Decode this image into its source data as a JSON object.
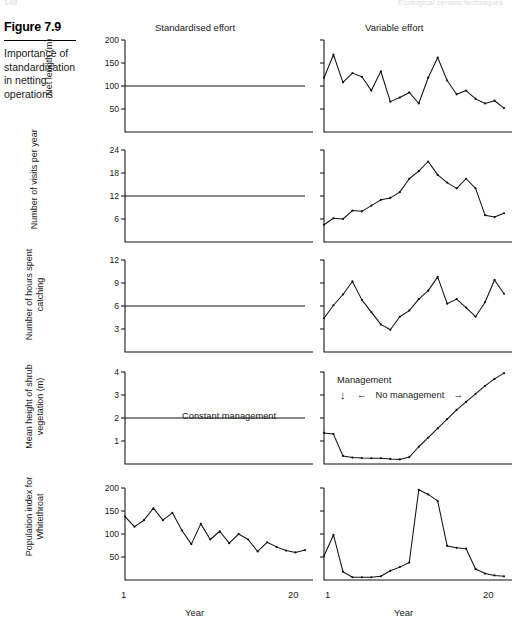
{
  "page": {
    "running_head_left": "148",
    "running_head_right": "Ecological census techniques"
  },
  "figure": {
    "number": "Figure 7.9",
    "caption": "Importance of standardisation in netting operations"
  },
  "columns": {
    "left_header": "Standardised effort",
    "right_header": "Variable effort"
  },
  "axis": {
    "x_label": "Year",
    "x_start": "1",
    "x_end": "20"
  },
  "annotations": {
    "constant_management": "Constant management",
    "management": "Management",
    "no_management": "No management",
    "arrow_down": "↓",
    "arrow_left": "←",
    "arrow_right": "→"
  },
  "chart_data": [
    {
      "id": "net-length-standardised",
      "type": "line",
      "row": 1,
      "column": "left",
      "title": "",
      "ylabel": "Net length (m)",
      "xlabel": "Year",
      "ylim": [
        0,
        200
      ],
      "yticks": [
        50,
        100,
        150,
        200
      ],
      "ytick_labels": [
        "50",
        "100",
        "150",
        "200"
      ],
      "xlim": [
        1,
        20
      ],
      "grid": false,
      "constant_value": 100,
      "x": [
        1,
        2,
        3,
        4,
        5,
        6,
        7,
        8,
        9,
        10,
        11,
        12,
        13,
        14,
        15,
        16,
        17,
        18,
        19,
        20
      ],
      "values": [
        100,
        100,
        100,
        100,
        100,
        100,
        100,
        100,
        100,
        100,
        100,
        100,
        100,
        100,
        100,
        100,
        100,
        100,
        100,
        100
      ]
    },
    {
      "id": "net-length-variable",
      "type": "line",
      "row": 1,
      "column": "right",
      "title": "",
      "ylabel": "Net length (m)",
      "xlabel": "Year",
      "ylim": [
        0,
        200
      ],
      "yticks": [
        50,
        100,
        150,
        200
      ],
      "ytick_labels": [
        "",
        "",
        "",
        ""
      ],
      "xlim": [
        1,
        20
      ],
      "grid": false,
      "x": [
        1,
        2,
        3,
        4,
        5,
        6,
        7,
        8,
        9,
        10,
        11,
        12,
        13,
        14,
        15,
        16,
        17,
        18,
        19,
        20
      ],
      "values": [
        118,
        168,
        108,
        128,
        120,
        90,
        132,
        66,
        75,
        86,
        62,
        118,
        162,
        112,
        82,
        90,
        72,
        62,
        68,
        52
      ]
    },
    {
      "id": "visits-standardised",
      "type": "line",
      "row": 2,
      "column": "left",
      "title": "",
      "ylabel": "Number of visits per year",
      "xlabel": "Year",
      "ylim": [
        0,
        24
      ],
      "yticks": [
        6,
        12,
        18,
        24
      ],
      "ytick_labels": [
        "6",
        "12",
        "18",
        "24"
      ],
      "xlim": [
        1,
        20
      ],
      "grid": false,
      "constant_value": 12,
      "x": [
        1,
        2,
        3,
        4,
        5,
        6,
        7,
        8,
        9,
        10,
        11,
        12,
        13,
        14,
        15,
        16,
        17,
        18,
        19,
        20
      ],
      "values": [
        12,
        12,
        12,
        12,
        12,
        12,
        12,
        12,
        12,
        12,
        12,
        12,
        12,
        12,
        12,
        12,
        12,
        12,
        12,
        12
      ]
    },
    {
      "id": "visits-variable",
      "type": "line",
      "row": 2,
      "column": "right",
      "title": "",
      "ylabel": "Number of visits per year",
      "xlabel": "Year",
      "ylim": [
        0,
        24
      ],
      "yticks": [
        6,
        12,
        18,
        24
      ],
      "ytick_labels": [
        "",
        "",
        "",
        ""
      ],
      "xlim": [
        1,
        20
      ],
      "grid": false,
      "x": [
        1,
        2,
        3,
        4,
        5,
        6,
        7,
        8,
        9,
        10,
        11,
        12,
        13,
        14,
        15,
        16,
        17,
        18,
        19,
        20
      ],
      "values": [
        4.5,
        6.2,
        6.0,
        8.2,
        8.0,
        9.5,
        11.0,
        11.5,
        13.0,
        16.5,
        18.5,
        21.0,
        17.5,
        15.5,
        14.0,
        16.5,
        14.0,
        7.0,
        6.5,
        7.5
      ]
    },
    {
      "id": "hours-standardised",
      "type": "line",
      "row": 3,
      "column": "left",
      "title": "",
      "ylabel": "Number of hours spent catching",
      "xlabel": "Year",
      "ylim": [
        0,
        12
      ],
      "yticks": [
        3,
        6,
        9,
        12
      ],
      "ytick_labels": [
        "3",
        "6",
        "9",
        "12"
      ],
      "xlim": [
        1,
        20
      ],
      "grid": false,
      "constant_value": 6,
      "x": [
        1,
        2,
        3,
        4,
        5,
        6,
        7,
        8,
        9,
        10,
        11,
        12,
        13,
        14,
        15,
        16,
        17,
        18,
        19,
        20
      ],
      "values": [
        6,
        6,
        6,
        6,
        6,
        6,
        6,
        6,
        6,
        6,
        6,
        6,
        6,
        6,
        6,
        6,
        6,
        6,
        6,
        6
      ]
    },
    {
      "id": "hours-variable",
      "type": "line",
      "row": 3,
      "column": "right",
      "title": "",
      "ylabel": "Number of hours spent catching",
      "xlabel": "Year",
      "ylim": [
        0,
        12
      ],
      "yticks": [
        3,
        6,
        9,
        12
      ],
      "ytick_labels": [
        "",
        "",
        "",
        ""
      ],
      "xlim": [
        1,
        20
      ],
      "grid": false,
      "x": [
        1,
        2,
        3,
        4,
        5,
        6,
        7,
        8,
        9,
        10,
        11,
        12,
        13,
        14,
        15,
        16,
        17,
        18,
        19,
        20
      ],
      "values": [
        4.4,
        6.1,
        7.5,
        9.2,
        6.8,
        5.2,
        3.6,
        2.9,
        4.6,
        5.4,
        6.9,
        8.0,
        9.8,
        6.3,
        6.9,
        5.8,
        4.6,
        6.5,
        9.4,
        7.6
      ]
    },
    {
      "id": "shrub-standardised",
      "type": "line",
      "row": 4,
      "column": "left",
      "title": "",
      "ylabel": "Mean height of shrub vegetation (m)",
      "xlabel": "Year",
      "ylim": [
        0,
        4
      ],
      "yticks": [
        1,
        2,
        3,
        4
      ],
      "ytick_labels": [
        "1",
        "2",
        "3",
        "4"
      ],
      "xlim": [
        1,
        20
      ],
      "grid": false,
      "constant_value": 2,
      "annotation": "Constant management",
      "x": [
        1,
        2,
        3,
        4,
        5,
        6,
        7,
        8,
        9,
        10,
        11,
        12,
        13,
        14,
        15,
        16,
        17,
        18,
        19,
        20
      ],
      "values": [
        2,
        2,
        2,
        2,
        2,
        2,
        2,
        2,
        2,
        2,
        2,
        2,
        2,
        2,
        2,
        2,
        2,
        2,
        2,
        2
      ]
    },
    {
      "id": "shrub-variable",
      "type": "line",
      "row": 4,
      "column": "right",
      "title": "",
      "ylabel": "Mean height of shrub vegetation (m)",
      "xlabel": "Year",
      "ylim": [
        0,
        4
      ],
      "yticks": [
        1,
        2,
        3,
        4
      ],
      "ytick_labels": [
        "",
        "",
        "",
        ""
      ],
      "xlim": [
        1,
        20
      ],
      "grid": false,
      "x": [
        1,
        2,
        3,
        4,
        5,
        6,
        7,
        8,
        9,
        10,
        11,
        12,
        13,
        14,
        15,
        16,
        17,
        18,
        19,
        20
      ],
      "values": [
        1.35,
        1.3,
        0.35,
        0.28,
        0.26,
        0.25,
        0.25,
        0.22,
        0.2,
        0.3,
        0.75,
        1.15,
        1.55,
        1.95,
        2.35,
        2.7,
        3.05,
        3.4,
        3.7,
        3.95
      ]
    },
    {
      "id": "whitethroat-standardised",
      "type": "line",
      "row": 5,
      "column": "left",
      "title": "",
      "ylabel": "Population index for Whitethroat",
      "xlabel": "Year",
      "ylim": [
        0,
        200
      ],
      "yticks": [
        50,
        100,
        150,
        200
      ],
      "ytick_labels": [
        "50",
        "100",
        "150",
        "200"
      ],
      "xlim": [
        1,
        20
      ],
      "grid": false,
      "x": [
        1,
        2,
        3,
        4,
        5,
        6,
        7,
        8,
        9,
        10,
        11,
        12,
        13,
        14,
        15,
        16,
        17,
        18,
        19,
        20
      ],
      "values": [
        138,
        116,
        130,
        156,
        130,
        146,
        108,
        78,
        122,
        88,
        106,
        80,
        100,
        88,
        62,
        82,
        72,
        64,
        60,
        65
      ]
    },
    {
      "id": "whitethroat-variable",
      "type": "line",
      "row": 5,
      "column": "right",
      "title": "",
      "ylabel": "Population index for Whitethroat",
      "xlabel": "Year",
      "ylim": [
        0,
        200
      ],
      "yticks": [
        50,
        100,
        150,
        200
      ],
      "ytick_labels": [
        "",
        "",
        "",
        ""
      ],
      "xlim": [
        1,
        20
      ],
      "grid": false,
      "x": [
        1,
        2,
        3,
        4,
        5,
        6,
        7,
        8,
        9,
        10,
        11,
        12,
        13,
        14,
        15,
        16,
        17,
        18,
        19,
        20
      ],
      "values": [
        52,
        98,
        18,
        6,
        6,
        6,
        8,
        20,
        28,
        38,
        196,
        186,
        172,
        74,
        70,
        68,
        24,
        14,
        10,
        8
      ]
    }
  ]
}
